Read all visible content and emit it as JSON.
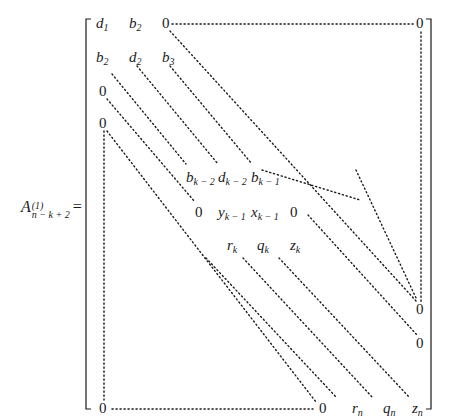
{
  "lhs": {
    "base": "A",
    "superscript": "(1)",
    "subscript": "n − k + 2",
    "equals": "="
  },
  "matrix": {
    "row1": [
      {
        "base": "d",
        "sub": "1"
      },
      {
        "base": "b",
        "sub": "2"
      },
      {
        "base": "0",
        "sub": ""
      },
      {
        "base": "0",
        "sub": ""
      }
    ],
    "row2": [
      {
        "base": "b",
        "sub": "2"
      },
      {
        "base": "d",
        "sub": "2"
      },
      {
        "base": "b",
        "sub": "3"
      }
    ],
    "left_zeros": [
      "0",
      "0"
    ],
    "middle_rows": [
      [
        {
          "base": "b",
          "sub": "k − 2"
        },
        {
          "base": "d",
          "sub": "k − 2"
        },
        {
          "base": "b",
          "sub": "k − 1"
        }
      ],
      [
        {
          "base": "0",
          "sub": ""
        },
        {
          "base": "y",
          "sub": "k − 1"
        },
        {
          "base": "x",
          "sub": "k − 1"
        },
        {
          "base": "0",
          "sub": ""
        }
      ],
      [
        {
          "base": "r",
          "sub": "k"
        },
        {
          "base": "q",
          "sub": "k"
        },
        {
          "base": "z",
          "sub": "k"
        }
      ]
    ],
    "right_zeros": [
      "0",
      "0"
    ],
    "last_row": [
      {
        "base": "0",
        "sub": ""
      },
      {
        "base": "0",
        "sub": ""
      },
      {
        "base": "r",
        "sub": "n"
      },
      {
        "base": "q",
        "sub": "n"
      },
      {
        "base": "z",
        "sub": "n"
      }
    ]
  },
  "colors": {
    "ink": "#1a1a1a",
    "background": "#ffffff"
  }
}
